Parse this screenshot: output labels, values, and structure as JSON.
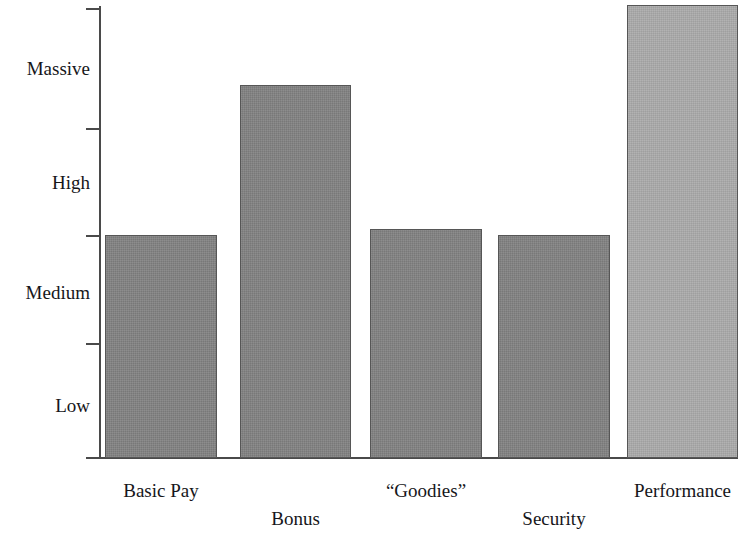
{
  "chart_data": {
    "type": "bar",
    "title": "",
    "subtitle": "",
    "xlabel": "",
    "ylabel": "",
    "categories": [
      "Basic Pay",
      "Bonus",
      "“Goodies”",
      "Security",
      "Performance"
    ],
    "values": [
      2.0,
      3.4,
      2.05,
      2.0,
      4.1
    ],
    "value_labels": [
      "Medium",
      "High-Massive",
      "Medium",
      "Medium",
      "Massive"
    ],
    "ytick_labels": [
      "Low",
      "Medium",
      "High",
      "Massive"
    ],
    "ytick_band_count": 4,
    "ylim": [
      0,
      4.2
    ],
    "grid": false,
    "legend": "none",
    "series": [
      {
        "name": "Reward element emphasis",
        "values": [
          2.0,
          3.4,
          2.05,
          2.0,
          4.1
        ]
      }
    ],
    "bar_colors": [
      "#828282",
      "#828282",
      "#828282",
      "#828282",
      "#ababab"
    ],
    "axis_color": "#4a4a4a",
    "background": "#ffffff"
  },
  "axis": {
    "y_labels": [
      {
        "text": "Massive",
        "center_y": 68
      },
      {
        "text": "High",
        "center_y": 182
      },
      {
        "text": "Medium",
        "center_y": 292
      },
      {
        "text": "Low",
        "center_y": 405
      }
    ],
    "ticks_y": [
      8,
      128,
      235,
      343,
      457
    ]
  },
  "bars": [
    {
      "label": "Basic Pay",
      "left": 105,
      "width": 112,
      "top": 235,
      "tone": "dark",
      "label_row": "top"
    },
    {
      "label": "Bonus",
      "left": 240,
      "width": 111,
      "top": 85,
      "tone": "dark",
      "label_row": "bottom"
    },
    {
      "label": "“Goodies”",
      "left": 370,
      "width": 112,
      "top": 229,
      "tone": "dark",
      "label_row": "top"
    },
    {
      "label": "Security",
      "left": 498,
      "width": 112,
      "top": 235,
      "tone": "dark",
      "label_row": "bottom"
    },
    {
      "label": "Performance",
      "left": 627,
      "width": 111,
      "top": 5,
      "tone": "light",
      "label_row": "top"
    }
  ]
}
